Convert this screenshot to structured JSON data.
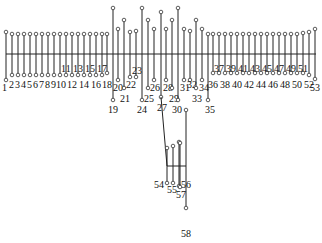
{
  "diagram": {
    "title": "",
    "colors": {
      "line": "#222222",
      "node_fill": "#ffffff",
      "text": "#111111"
    },
    "bus": {
      "y": 54,
      "x1": 6,
      "x2": 316
    },
    "branches": [
      {
        "x": 6,
        "top": 32,
        "bottom": 80,
        "label": "1",
        "lx": 2,
        "ly": 91
      },
      {
        "x": 12,
        "top": 34,
        "bottom": 75,
        "label": "2",
        "lx": 9,
        "ly": 88
      },
      {
        "x": 18,
        "top": 34,
        "bottom": 75,
        "label": "3",
        "lx": 15,
        "ly": 88
      },
      {
        "x": 24,
        "top": 34,
        "bottom": 75,
        "label": "4",
        "lx": 21,
        "ly": 88
      },
      {
        "x": 30,
        "top": 34,
        "bottom": 75,
        "label": "5",
        "lx": 27,
        "ly": 88
      },
      {
        "x": 36,
        "top": 34,
        "bottom": 75,
        "label": "6",
        "lx": 33,
        "ly": 88
      },
      {
        "x": 42,
        "top": 34,
        "bottom": 75,
        "label": "7",
        "lx": 39,
        "ly": 88
      },
      {
        "x": 48,
        "top": 34,
        "bottom": 75,
        "label": "8",
        "lx": 45,
        "ly": 88
      },
      {
        "x": 54,
        "top": 34,
        "bottom": 75,
        "label": "9",
        "lx": 51,
        "ly": 88
      },
      {
        "x": 60,
        "top": 34,
        "bottom": 75,
        "label": "10",
        "lx": 56,
        "ly": 88
      },
      {
        "x": 66,
        "top": 34,
        "bottom": 75,
        "label": "11",
        "lx": 61,
        "ly": 72
      },
      {
        "x": 72,
        "top": 34,
        "bottom": 75,
        "label": "12",
        "lx": 67,
        "ly": 88
      },
      {
        "x": 78,
        "top": 34,
        "bottom": 75,
        "label": "13",
        "lx": 73,
        "ly": 72
      },
      {
        "x": 84,
        "top": 34,
        "bottom": 75,
        "label": "14",
        "lx": 79,
        "ly": 88
      },
      {
        "x": 90,
        "top": 34,
        "bottom": 75,
        "label": "15",
        "lx": 85,
        "ly": 72
      },
      {
        "x": 96,
        "top": 34,
        "bottom": 75,
        "label": "16",
        "lx": 91,
        "ly": 88
      },
      {
        "x": 102,
        "top": 34,
        "bottom": 75,
        "label": "17",
        "lx": 97,
        "ly": 72
      },
      {
        "x": 107,
        "top": 34,
        "bottom": 73,
        "label": "18",
        "lx": 102,
        "ly": 88
      },
      {
        "x": 113,
        "top": 8,
        "bottom": 100,
        "label": "19",
        "lx": 108,
        "ly": 113
      },
      {
        "x": 118,
        "top": 29,
        "bottom": 80,
        "label": "20",
        "lx": 113,
        "ly": 91
      },
      {
        "x": 124,
        "top": 20,
        "bottom": 88,
        "label": "21",
        "lx": 120,
        "ly": 102
      },
      {
        "x": 130,
        "top": 32,
        "bottom": 77,
        "label": "22",
        "lx": 126,
        "ly": 88
      },
      {
        "x": 136,
        "top": 31,
        "bottom": 77,
        "label": "23",
        "lx": 132,
        "ly": 74
      },
      {
        "x": 142,
        "top": 8,
        "bottom": 100,
        "label": "24",
        "lx": 137,
        "ly": 113
      },
      {
        "x": 148,
        "top": 20,
        "bottom": 88,
        "label": "25",
        "lx": 144,
        "ly": 102
      },
      {
        "x": 154,
        "top": 29,
        "bottom": 80,
        "label": "26",
        "lx": 150,
        "ly": 91
      },
      {
        "x": 161,
        "top": 12,
        "bottom": 97,
        "label": "27",
        "lx": 157,
        "ly": 111
      },
      {
        "x": 166,
        "top": 29,
        "bottom": 80,
        "label": "28",
        "lx": 163,
        "ly": 91
      },
      {
        "x": 172,
        "top": 20,
        "bottom": 88,
        "label": "29",
        "lx": 169,
        "ly": 102
      },
      {
        "x": 178,
        "top": 8,
        "bottom": 100,
        "label": "30",
        "lx": 172,
        "ly": 113
      },
      {
        "x": 184,
        "top": 29,
        "bottom": 80,
        "label": "31",
        "lx": 180,
        "ly": 91
      },
      {
        "x": 190,
        "top": 31,
        "bottom": 80,
        "label": "32",
        "lx": 187,
        "ly": 88
      },
      {
        "x": 196,
        "top": 20,
        "bottom": 88,
        "label": "33",
        "lx": 192,
        "ly": 102
      },
      {
        "x": 202,
        "top": 29,
        "bottom": 80,
        "label": "34",
        "lx": 199,
        "ly": 91
      },
      {
        "x": 208,
        "top": 34,
        "bottom": 100,
        "label": "35",
        "lx": 205,
        "ly": 113
      },
      {
        "x": 213,
        "top": 34,
        "bottom": 73,
        "label": "36",
        "lx": 208,
        "ly": 88
      },
      {
        "x": 219,
        "top": 34,
        "bottom": 73,
        "label": "37",
        "lx": 214,
        "ly": 72
      },
      {
        "x": 225,
        "top": 34,
        "bottom": 73,
        "label": "38",
        "lx": 220,
        "ly": 88
      },
      {
        "x": 231,
        "top": 34,
        "bottom": 73,
        "label": "39",
        "lx": 226,
        "ly": 72
      },
      {
        "x": 237,
        "top": 34,
        "bottom": 73,
        "label": "40",
        "lx": 232,
        "ly": 88
      },
      {
        "x": 243,
        "top": 34,
        "bottom": 73,
        "label": "41",
        "lx": 238,
        "ly": 72
      },
      {
        "x": 249,
        "top": 34,
        "bottom": 73,
        "label": "42",
        "lx": 244,
        "ly": 88
      },
      {
        "x": 255,
        "top": 34,
        "bottom": 73,
        "label": "43",
        "lx": 250,
        "ly": 72
      },
      {
        "x": 261,
        "top": 34,
        "bottom": 73,
        "label": "44",
        "lx": 256,
        "ly": 88
      },
      {
        "x": 267,
        "top": 34,
        "bottom": 73,
        "label": "45",
        "lx": 262,
        "ly": 72
      },
      {
        "x": 273,
        "top": 34,
        "bottom": 73,
        "label": "46",
        "lx": 268,
        "ly": 88
      },
      {
        "x": 279,
        "top": 34,
        "bottom": 73,
        "label": "47",
        "lx": 274,
        "ly": 72
      },
      {
        "x": 285,
        "top": 34,
        "bottom": 73,
        "label": "48",
        "lx": 280,
        "ly": 88
      },
      {
        "x": 291,
        "top": 34,
        "bottom": 73,
        "label": "49",
        "lx": 286,
        "ly": 72
      },
      {
        "x": 297,
        "top": 34,
        "bottom": 73,
        "label": "50",
        "lx": 292,
        "ly": 88
      },
      {
        "x": 303,
        "top": 33,
        "bottom": 73,
        "label": "51",
        "lx": 298,
        "ly": 72
      },
      {
        "x": 309,
        "top": 32,
        "bottom": 75,
        "label": "52",
        "lx": 304,
        "ly": 88
      },
      {
        "x": 315,
        "top": 29,
        "bottom": 79,
        "label": "53",
        "lx": 310,
        "ly": 91
      }
    ],
    "subtree": {
      "trunk": {
        "x1": 161,
        "y1": 97,
        "x2": 167,
        "y2": 166
      },
      "bar": {
        "y": 166,
        "x1": 167,
        "x2": 186
      },
      "right_trunk": {
        "x": 186,
        "y1": 110,
        "y2": 208
      },
      "branches": [
        {
          "x": 167,
          "top": 148,
          "bottom": 183,
          "label": "54",
          "lx": 154,
          "ly": 188
        },
        {
          "x": 173,
          "top": 146,
          "bottom": 183,
          "label": "55",
          "lx": 167,
          "ly": 193
        },
        {
          "x": 179,
          "top": 142,
          "bottom": 186,
          "label": "56",
          "lx": 181,
          "ly": 188
        },
        {
          "x": 180,
          "top": 143,
          "bottom": 187,
          "label": "57",
          "lx": 176,
          "ly": 198
        }
      ],
      "end_node": {
        "x": 186,
        "y": 208,
        "label": "58",
        "lx": 181,
        "ly": 237
      },
      "node_30": {
        "x": 186,
        "y": 110
      }
    }
  }
}
